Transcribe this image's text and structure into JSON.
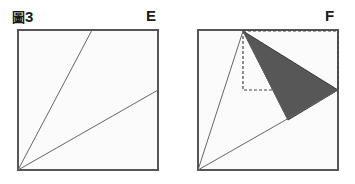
{
  "figure": {
    "number_prefix": "圖",
    "number": "3",
    "caption_full": "圖3",
    "width": 355,
    "height": 184,
    "background_color": "#ffffff"
  },
  "labels": {
    "left_panel": "E",
    "right_panel": "F"
  },
  "style": {
    "square_fill": "#fbfbfb",
    "square_stroke": "#555555",
    "square_stroke_width": 2,
    "inner_line_stroke": "#666666",
    "inner_line_width": 1,
    "shaded_fill": "#575757",
    "shaded_stroke": "#3a3a3a",
    "dashed_stroke": "#444444",
    "dash_pattern": "3,2",
    "label_color": "#1a1a1a"
  },
  "panels": [
    {
      "id": "panel-e",
      "name": "square-diagram-e",
      "label": "E",
      "square": {
        "x": 18,
        "y": 30,
        "width": 140,
        "height": 140
      },
      "shaded_triangles": [],
      "dashed_rects": [],
      "inner_lines": [
        {
          "name": "cevian-to-top-edge",
          "x1": 18,
          "y1": 170,
          "x2": 92,
          "y2": 30
        },
        {
          "name": "cevian-to-right-edge",
          "x1": 18,
          "y1": 170,
          "x2": 158,
          "y2": 90
        }
      ]
    },
    {
      "id": "panel-f",
      "name": "square-diagram-f",
      "label": "F",
      "square": {
        "x": 198,
        "y": 30,
        "width": 140,
        "height": 140
      },
      "shaded_triangles": [
        {
          "name": "shaded-triangle",
          "points": "243,31 338,90 288,120"
        }
      ],
      "dashed_rects": [
        {
          "name": "dashed-construction-rect",
          "x": 243,
          "y": 31,
          "width": 95,
          "height": 59
        }
      ],
      "inner_lines": [
        {
          "name": "cevian-to-top-edge",
          "x1": 198,
          "y1": 170,
          "x2": 243,
          "y2": 31
        },
        {
          "name": "fold-edge-left",
          "x1": 243,
          "y1": 31,
          "x2": 288,
          "y2": 120
        },
        {
          "name": "cevian-to-right-edge",
          "x1": 198,
          "y1": 170,
          "x2": 338,
          "y2": 90
        }
      ]
    }
  ]
}
